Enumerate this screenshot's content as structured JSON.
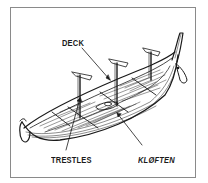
{
  "diagram": {
    "labels": {
      "deck": "DECK",
      "trestles": "TRESTLES",
      "kloften": "KLØFTEN"
    },
    "colors": {
      "ink": "#1a1a1a",
      "frame": "#8a8a8a",
      "background": "#ffffff"
    }
  }
}
